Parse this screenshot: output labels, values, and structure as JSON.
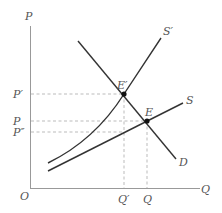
{
  "diagram": {
    "type": "supply-demand",
    "axes": {
      "y_label": "P",
      "x_label": "Q",
      "origin_label": "O"
    },
    "curves": {
      "supply": "S",
      "supply_shifted": "S′",
      "demand": "D"
    },
    "points": {
      "new_equilibrium": "E′",
      "equilibrium": "E"
    },
    "price_ticks": {
      "p_prime": "P′",
      "p": "P",
      "p_double_prime": "P″"
    },
    "quantity_ticks": {
      "q_prime": "Q′",
      "q": "Q"
    },
    "colors": {
      "axis": "#999999",
      "curve": "#333333",
      "guide": "#aaaaaa",
      "label": "#555555"
    }
  }
}
